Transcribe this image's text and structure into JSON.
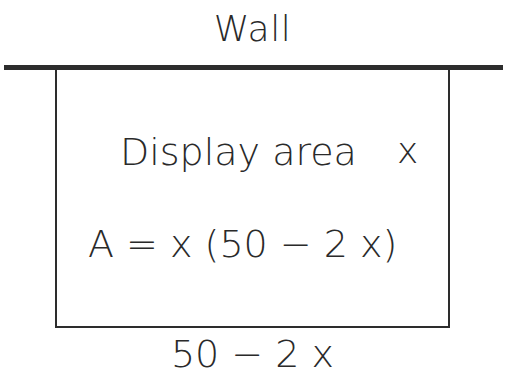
{
  "diagram": {
    "wall_label": "Wall",
    "region_label": "Display area",
    "side_label": "x",
    "formula": "A = x (50 − 2 x)",
    "bottom_label": "50 − 2 x",
    "colors": {
      "line": "#2d2d2d",
      "text": "#2a2a2a",
      "background": "#ffffff"
    }
  }
}
